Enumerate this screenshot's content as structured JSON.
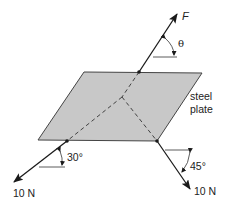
{
  "diagram": {
    "plate": {
      "label_line1": "steel",
      "label_line2": "plate",
      "fill": "#c8c8c8",
      "stroke": "#444444"
    },
    "forces": [
      {
        "id": "F",
        "label": "F",
        "angle_label": "θ",
        "direction": "up-right"
      },
      {
        "id": "left",
        "label": "10 N",
        "angle_label": "30°",
        "direction": "down-left"
      },
      {
        "id": "right",
        "label": "10 N",
        "angle_label": "45°",
        "direction": "down-right"
      }
    ],
    "colors": {
      "line": "#1a1a1a",
      "plate_fill": "#c8c8c8",
      "background": "#ffffff"
    }
  }
}
